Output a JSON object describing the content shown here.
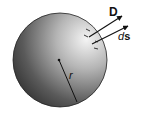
{
  "diagram": {
    "labels": {
      "flux_density": "D",
      "surface_element_prefix": "d",
      "surface_element_suffix": "s",
      "radius": "r"
    },
    "colors": {
      "sphere_light": "#f2f2f2",
      "sphere_dark": "#3a3a3a",
      "stroke": "#111111"
    }
  }
}
